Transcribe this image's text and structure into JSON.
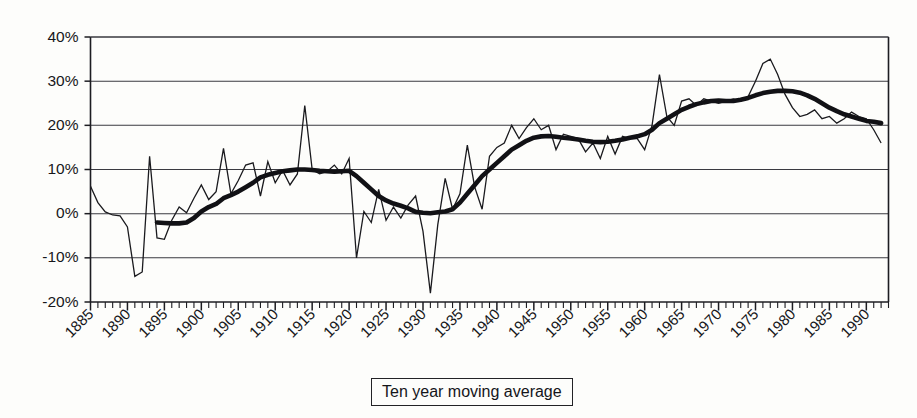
{
  "legend": {
    "label": "Ten year moving average"
  },
  "chart_data": {
    "type": "line",
    "title": "",
    "xlabel": "",
    "ylabel": "",
    "xlim": [
      1885,
      1993
    ],
    "ylim": [
      -20,
      40
    ],
    "grid": true,
    "y_ticks": [
      40,
      30,
      20,
      10,
      0,
      -10,
      -20
    ],
    "y_tick_labels": [
      "40%",
      "30%",
      "20%",
      "10%",
      "0%",
      "-10%",
      "-20%"
    ],
    "x_ticks": [
      1885,
      1890,
      1895,
      1900,
      1905,
      1910,
      1915,
      1920,
      1925,
      1930,
      1935,
      1940,
      1945,
      1950,
      1955,
      1960,
      1965,
      1970,
      1975,
      1980,
      1985,
      1990
    ],
    "x_tick_labels": [
      "1885",
      "1890",
      "1895",
      "1900",
      "1905",
      "1910",
      "1915",
      "1920",
      "1925",
      "1930",
      "1935",
      "1940",
      "1945",
      "1950",
      "1955",
      "1960",
      "1965",
      "1970",
      "1975",
      "1980",
      "1985",
      "1990"
    ],
    "x_minor_tick_step": 1,
    "x_tick_label_rotation": -45,
    "legend_position": "below-axis-center",
    "series": [
      {
        "name": "Annual series",
        "style": "thin",
        "color": "#1a1a1e",
        "width": 1.3,
        "x": [
          1885,
          1886,
          1887,
          1888,
          1889,
          1890,
          1891,
          1892,
          1893,
          1894,
          1895,
          1896,
          1897,
          1898,
          1899,
          1900,
          1901,
          1902,
          1903,
          1904,
          1905,
          1906,
          1907,
          1908,
          1909,
          1910,
          1911,
          1912,
          1913,
          1914,
          1915,
          1916,
          1917,
          1918,
          1919,
          1920,
          1921,
          1922,
          1923,
          1924,
          1925,
          1926,
          1927,
          1928,
          1929,
          1930,
          1931,
          1932,
          1933,
          1934,
          1935,
          1936,
          1937,
          1938,
          1939,
          1940,
          1941,
          1942,
          1943,
          1944,
          1945,
          1946,
          1947,
          1948,
          1949,
          1950,
          1951,
          1952,
          1953,
          1954,
          1955,
          1956,
          1957,
          1958,
          1959,
          1960,
          1961,
          1962,
          1963,
          1964,
          1965,
          1966,
          1967,
          1968,
          1969,
          1970,
          1971,
          1972,
          1973,
          1974,
          1975,
          1976,
          1977,
          1978,
          1979,
          1980,
          1981,
          1982,
          1983,
          1984,
          1985,
          1986,
          1987,
          1988,
          1989,
          1990,
          1991,
          1992
        ],
        "values": [
          6.2,
          2.5,
          0.4,
          -0.3,
          -0.5,
          -3.0,
          -14.2,
          -13.2,
          13.0,
          -5.5,
          -5.8,
          -1.5,
          1.5,
          0.2,
          3.5,
          6.5,
          3.2,
          5.0,
          14.8,
          4.5,
          7.5,
          11.0,
          11.5,
          4.0,
          11.8,
          7.0,
          9.8,
          6.5,
          9.0,
          24.5,
          10.0,
          9.0,
          9.5,
          11.0,
          9.0,
          12.5,
          -10.0,
          0.5,
          -2.0,
          5.5,
          -1.5,
          1.5,
          -1.0,
          2.0,
          4.0,
          -4.0,
          -18.0,
          -2.5,
          8.0,
          1.0,
          4.5,
          15.5,
          6.0,
          1.0,
          13.0,
          15.0,
          16.0,
          20.0,
          17.0,
          19.5,
          21.5,
          19.0,
          20.0,
          14.5,
          18.0,
          17.5,
          17.0,
          14.0,
          16.0,
          12.5,
          17.5,
          13.5,
          17.5,
          17.0,
          17.0,
          14.5,
          20.0,
          31.5,
          22.0,
          20.0,
          25.5,
          26.0,
          24.5,
          26.0,
          25.5,
          25.0,
          25.5,
          26.0,
          25.5,
          26.5,
          30.0,
          34.0,
          35.0,
          31.5,
          27.0,
          24.0,
          22.0,
          22.5,
          23.5,
          21.5,
          22.0,
          20.5,
          21.5,
          23.0,
          22.0,
          21.5,
          19.0,
          16.0
        ]
      },
      {
        "name": "Ten year moving average",
        "style": "thick",
        "color": "#111115",
        "width": 4.6,
        "x": [
          1894,
          1895,
          1896,
          1897,
          1898,
          1899,
          1900,
          1901,
          1902,
          1903,
          1904,
          1905,
          1906,
          1907,
          1908,
          1909,
          1910,
          1911,
          1912,
          1913,
          1914,
          1915,
          1916,
          1917,
          1918,
          1919,
          1920,
          1921,
          1922,
          1923,
          1924,
          1925,
          1926,
          1927,
          1928,
          1929,
          1930,
          1931,
          1932,
          1933,
          1934,
          1935,
          1936,
          1937,
          1938,
          1939,
          1940,
          1941,
          1942,
          1943,
          1944,
          1945,
          1946,
          1947,
          1948,
          1949,
          1950,
          1951,
          1952,
          1953,
          1954,
          1955,
          1956,
          1957,
          1958,
          1959,
          1960,
          1961,
          1962,
          1963,
          1964,
          1965,
          1966,
          1967,
          1968,
          1969,
          1970,
          1971,
          1972,
          1973,
          1974,
          1975,
          1976,
          1977,
          1978,
          1979,
          1980,
          1981,
          1982,
          1983,
          1984,
          1985,
          1986,
          1987,
          1988,
          1989,
          1990,
          1991,
          1992
        ],
        "values": [
          -2.0,
          -2.1,
          -2.2,
          -2.2,
          -2.0,
          -1.0,
          0.5,
          1.5,
          2.2,
          3.5,
          4.2,
          5.0,
          6.0,
          7.0,
          8.2,
          8.8,
          9.2,
          9.6,
          9.8,
          10.0,
          10.0,
          9.9,
          9.7,
          9.6,
          9.5,
          9.6,
          9.7,
          8.5,
          7.0,
          5.5,
          4.0,
          3.0,
          2.3,
          1.8,
          1.2,
          0.4,
          0.2,
          0.1,
          0.3,
          0.5,
          1.0,
          2.5,
          4.5,
          6.5,
          8.5,
          10.0,
          11.5,
          13.0,
          14.5,
          15.5,
          16.5,
          17.2,
          17.5,
          17.6,
          17.4,
          17.2,
          17.0,
          16.8,
          16.5,
          16.3,
          16.2,
          16.3,
          16.5,
          16.8,
          17.2,
          17.5,
          18.0,
          19.0,
          20.5,
          21.5,
          22.5,
          23.5,
          24.2,
          24.8,
          25.2,
          25.5,
          25.6,
          25.5,
          25.5,
          25.8,
          26.2,
          26.8,
          27.3,
          27.6,
          27.8,
          27.8,
          27.7,
          27.4,
          26.8,
          26.0,
          25.0,
          24.0,
          23.2,
          22.5,
          22.0,
          21.5,
          21.0,
          20.8,
          20.5
        ]
      }
    ]
  }
}
